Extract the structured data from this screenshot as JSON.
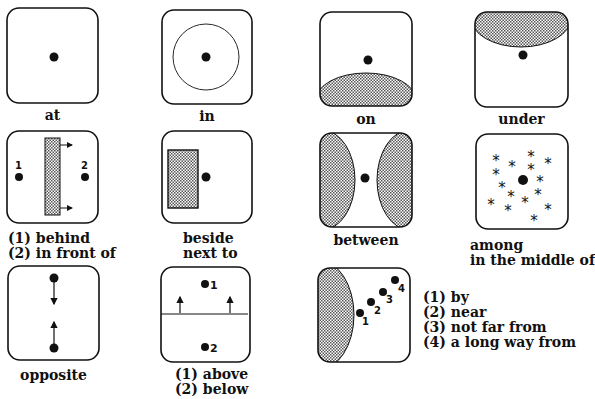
{
  "panels": [
    {
      "id": "at",
      "label_lines": [
        "at"
      ]
    },
    {
      "id": "in",
      "label_lines": [
        "in"
      ]
    },
    {
      "id": "on",
      "label_lines": [
        "on"
      ]
    },
    {
      "id": "under",
      "label_lines": [
        "under"
      ]
    },
    {
      "id": "behind-in-front-of",
      "label_lines": [
        "(1) behind",
        "(2) in front of"
      ],
      "markers": [
        "1",
        "2"
      ]
    },
    {
      "id": "beside",
      "label_lines": [
        "beside",
        "next to"
      ]
    },
    {
      "id": "between",
      "label_lines": [
        "between"
      ]
    },
    {
      "id": "among",
      "label_lines": [
        "among",
        "in the middle of"
      ]
    },
    {
      "id": "opposite",
      "label_lines": [
        "opposite"
      ]
    },
    {
      "id": "above-below",
      "label_lines": [
        "(1) above",
        "(2) below"
      ],
      "markers": [
        "1",
        "2"
      ]
    },
    {
      "id": "distance",
      "label_lines": [
        "(1) by",
        "(2) near",
        "(3) not far from",
        "(4) a long way from"
      ],
      "markers": [
        "1",
        "2",
        "3",
        "4"
      ]
    }
  ],
  "colors": {
    "ink": "#111111",
    "background": "#ffffff",
    "hatch": "#888888"
  }
}
